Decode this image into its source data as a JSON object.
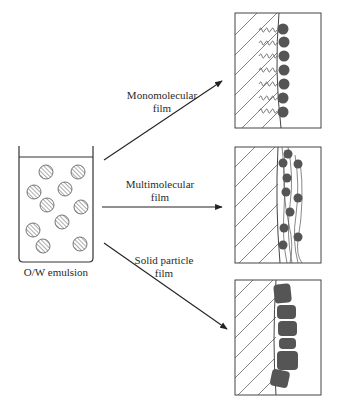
{
  "diagram": {
    "source": {
      "label": "O/W emulsion",
      "droplet_count": 10
    },
    "arrows": [
      {
        "id": "monomolecular",
        "label_line1": "Monomolecular",
        "label_line2": "film"
      },
      {
        "id": "multimolecular",
        "label_line1": "Multimolecular",
        "label_line2": "film"
      },
      {
        "id": "solid-particle",
        "label_line1": "Solid particle",
        "label_line2": "film"
      }
    ],
    "panels": [
      {
        "id": "monomolecular-panel",
        "description": "Surfactant molecules with tails in oil and heads at interface",
        "head_count": 7
      },
      {
        "id": "multimolecular-panel",
        "description": "Polymer chains with multiple adsorbed units at interface",
        "unit_count": 10
      },
      {
        "id": "solid-particle-panel",
        "description": "Solid particles packed at the interface",
        "particle_count": 6
      }
    ],
    "colors": {
      "line": "#333333",
      "fill_dark": "#555555",
      "hatch": "#666666",
      "background": "#ffffff"
    }
  }
}
